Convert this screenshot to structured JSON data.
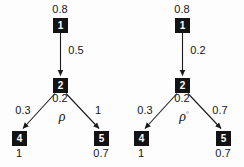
{
  "figure": {
    "background_color": "#fdfdfd",
    "node_color": "#131313",
    "node_text_color": "#ffffff",
    "edge_color": "#1a1a1a",
    "text_color": "#161616"
  },
  "diagrams": [
    {
      "name": "left",
      "symbol": "ρ",
      "symbol_superscript": "",
      "nodes": [
        {
          "id": "1",
          "label": "1",
          "value": "0.8",
          "role": "root"
        },
        {
          "id": "2",
          "label": "2",
          "value": "0.2",
          "role": "mid"
        },
        {
          "id": "4",
          "label": "4",
          "value": "1",
          "role": "leaf-left"
        },
        {
          "id": "5",
          "label": "5",
          "value": "0.7",
          "role": "leaf-right"
        }
      ],
      "edges": [
        {
          "from": "1",
          "to": "2",
          "weight": "0.5",
          "position": "top"
        },
        {
          "from": "2",
          "to": "4",
          "weight": "0.3",
          "position": "left"
        },
        {
          "from": "2",
          "to": "5",
          "weight": "1",
          "position": "right"
        }
      ]
    },
    {
      "name": "right",
      "symbol": "ρ",
      "symbol_superscript": "◦",
      "nodes": [
        {
          "id": "1",
          "label": "1",
          "value": "0.8",
          "role": "root"
        },
        {
          "id": "2",
          "label": "2",
          "value": "0.2",
          "role": "mid"
        },
        {
          "id": "4",
          "label": "4",
          "value": "1",
          "role": "leaf-left"
        },
        {
          "id": "5",
          "label": "5",
          "value": "0.7",
          "role": "leaf-right"
        }
      ],
      "edges": [
        {
          "from": "1",
          "to": "2",
          "weight": "0.2",
          "position": "top"
        },
        {
          "from": "2",
          "to": "4",
          "weight": "0.3",
          "position": "left"
        },
        {
          "from": "2",
          "to": "5",
          "weight": "0.7",
          "position": "right"
        }
      ]
    }
  ]
}
